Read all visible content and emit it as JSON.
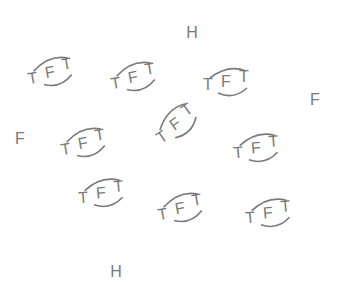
{
  "colors": {
    "background": "#ffffff",
    "glyph": "#7a7a7a"
  },
  "stray_atoms": [
    {
      "symbol": "H",
      "x": 192,
      "y": 33
    },
    {
      "symbol": "F",
      "x": 315,
      "y": 100
    },
    {
      "symbol": "F",
      "x": 20,
      "y": 139
    },
    {
      "symbol": "H",
      "x": 116,
      "y": 272
    }
  ],
  "molecules": [
    {
      "left_atom": "T",
      "center_atom": "F",
      "right_atom": "T",
      "cx": 52,
      "cy": 72,
      "rotate": -10
    },
    {
      "left_atom": "T",
      "center_atom": "F",
      "right_atom": "T",
      "cx": 135,
      "cy": 77,
      "rotate": -10
    },
    {
      "left_atom": "T",
      "center_atom": "F",
      "right_atom": "T",
      "cx": 228,
      "cy": 82,
      "rotate": 0
    },
    {
      "left_atom": "T",
      "center_atom": "F",
      "right_atom": "T",
      "cx": 177,
      "cy": 123,
      "rotate": -35
    },
    {
      "left_atom": "T",
      "center_atom": "F",
      "right_atom": "T",
      "cx": 85,
      "cy": 143,
      "rotate": -10
    },
    {
      "left_atom": "T",
      "center_atom": "F",
      "right_atom": "T",
      "cx": 258,
      "cy": 148,
      "rotate": -5
    },
    {
      "left_atom": "T",
      "center_atom": "F",
      "right_atom": "T",
      "cx": 103,
      "cy": 193,
      "rotate": -5
    },
    {
      "left_atom": "T",
      "center_atom": "F",
      "right_atom": "T",
      "cx": 182,
      "cy": 208,
      "rotate": -10
    },
    {
      "left_atom": "T",
      "center_atom": "F",
      "right_atom": "T",
      "cx": 270,
      "cy": 213,
      "rotate": -5
    }
  ]
}
